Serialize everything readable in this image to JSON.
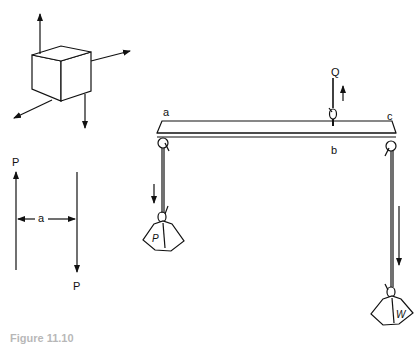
{
  "figure": {
    "cube_diagram": {
      "description": "cube with four force arrows"
    },
    "couple_diagram": {
      "force_top_label": "P",
      "force_bottom_label": "P",
      "distance_label": "a"
    },
    "beam_diagram": {
      "end_left_label": "a",
      "middle_label": "b",
      "end_right_label": "c",
      "lift_force_label": "Q",
      "left_weight_label": "P",
      "right_weight_label": "W"
    },
    "caption": "Figure 11.10"
  }
}
